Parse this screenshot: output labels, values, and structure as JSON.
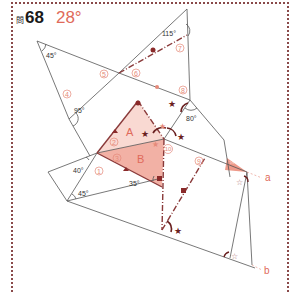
{
  "header": {
    "question_prefix": "問",
    "question_number": "68",
    "answer": "28°"
  },
  "angles": {
    "a45_top": "45°",
    "a95": "95°",
    "a115": "115°",
    "a80": "80°",
    "a40": "40°",
    "a45_bottom": "45°",
    "a35": "35°"
  },
  "circled_labels": [
    "1",
    "2",
    "3",
    "4",
    "5",
    "6",
    "7",
    "8",
    "9",
    "10"
  ],
  "region_labels": {
    "A": "A",
    "B": "B"
  },
  "line_labels": {
    "a": "a",
    "b": "b"
  },
  "markers": {
    "filled_star": "★",
    "hollow_star": "☆",
    "pink_star": "★"
  },
  "colors": {
    "accent": "#e06a5a",
    "region_A": "#f9d9d2",
    "region_B": "#f2b1a5",
    "dark_red": "#8a3a3a",
    "frame": "#8a4a4a"
  }
}
